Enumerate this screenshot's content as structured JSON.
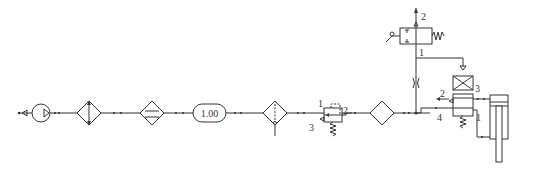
{
  "diagram": {
    "type": "pneumatic-circuit",
    "components": [
      {
        "id": "source",
        "name": "air-source"
      },
      {
        "id": "compressor",
        "name": "compressor"
      },
      {
        "id": "cooler",
        "name": "aftercooler"
      },
      {
        "id": "dryer",
        "name": "air-dryer"
      },
      {
        "id": "receiver",
        "name": "air-receiver",
        "label": "1.00"
      },
      {
        "id": "filter",
        "name": "filter-with-drain"
      },
      {
        "id": "regulator",
        "name": "pressure-regulator",
        "ports": [
          "1",
          "2",
          "3"
        ]
      },
      {
        "id": "lubricator",
        "name": "lubricator"
      },
      {
        "id": "throttle",
        "name": "throttle-valve"
      },
      {
        "id": "pedal_valve",
        "name": "3-2-pedal-valve",
        "ports": [
          "2",
          "1"
        ]
      },
      {
        "id": "main_valve",
        "name": "4-2-pilot-valve",
        "ports": [
          "2",
          "3",
          "4",
          "1"
        ]
      },
      {
        "id": "cylinder",
        "name": "double-acting-cylinder"
      }
    ],
    "labels": {
      "receiver_value": "1.00",
      "reg_port_1": "1",
      "reg_port_2": "2",
      "reg_port_3": "3",
      "pedal_port_2": "2",
      "pedal_port_1": "1",
      "valve_port_2": "2",
      "valve_port_3": "3",
      "valve_port_4": "4",
      "valve_port_1": "1"
    }
  }
}
